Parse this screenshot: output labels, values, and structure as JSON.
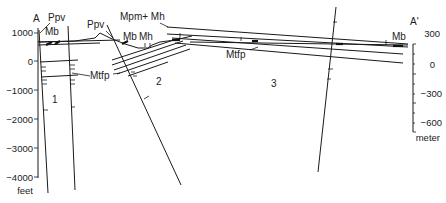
{
  "section": {
    "start_label": "A",
    "end_label": "A'",
    "block_labels": [
      "1",
      "2",
      "3"
    ]
  },
  "left_axis": {
    "unit": "feet",
    "ticks": [
      "1000",
      "0",
      "−1000",
      "−2000",
      "−3000",
      "−4000"
    ]
  },
  "right_axis": {
    "unit": "meter",
    "ticks": [
      "300",
      "0",
      "−300",
      "−600"
    ]
  },
  "units": {
    "ppv_left": "Ppv",
    "ppv_mid": "Ppv",
    "mb_left": "Mb",
    "mb_mid": "Mb",
    "mh_mid": "Mh",
    "mpm_mh": "Mpm+ Mh",
    "mtfp_left": "Mtfp",
    "mtfp_right": "Mtfp",
    "mb_right": "Mb"
  }
}
